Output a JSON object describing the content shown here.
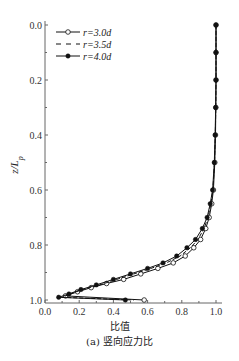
{
  "chart_data": {
    "type": "line",
    "title": "",
    "caption": "(a) 竖向应力比",
    "xlabel": "比值",
    "ylabel": "z/Lp",
    "xlim": [
      0.0,
      1.0
    ],
    "ylim": [
      0.0,
      1.0
    ],
    "y_inverted": true,
    "grid": false,
    "legend_position": "upper left",
    "x_ticks": [
      "0.0",
      "0.2",
      "0.4",
      "0.6",
      "0.8",
      "1.0"
    ],
    "y_ticks": [
      "0.0",
      "0.2",
      "0.4",
      "0.6",
      "0.8",
      "1.0"
    ],
    "series": [
      {
        "name": "r=3.0d",
        "marker": "open-circle",
        "line": "solid",
        "points": [
          [
            1.0,
            0.0
          ],
          [
            1.0,
            0.1
          ],
          [
            1.0,
            0.2
          ],
          [
            0.999,
            0.3
          ],
          [
            0.997,
            0.4
          ],
          [
            0.993,
            0.5
          ],
          [
            0.985,
            0.6
          ],
          [
            0.975,
            0.65
          ],
          [
            0.96,
            0.7
          ],
          [
            0.94,
            0.74
          ],
          [
            0.91,
            0.78
          ],
          [
            0.87,
            0.81
          ],
          [
            0.82,
            0.84
          ],
          [
            0.75,
            0.865
          ],
          [
            0.66,
            0.885
          ],
          [
            0.56,
            0.905
          ],
          [
            0.46,
            0.925
          ],
          [
            0.36,
            0.94
          ],
          [
            0.27,
            0.955
          ],
          [
            0.19,
            0.97
          ],
          [
            0.12,
            0.985
          ],
          [
            0.58,
            1.0
          ]
        ]
      },
      {
        "name": "r=3.5d",
        "marker": "none",
        "line": "dashed",
        "points": [
          [
            1.0,
            0.0
          ],
          [
            1.0,
            0.1
          ],
          [
            1.0,
            0.2
          ],
          [
            0.999,
            0.3
          ],
          [
            0.996,
            0.4
          ],
          [
            0.991,
            0.5
          ],
          [
            0.982,
            0.6
          ],
          [
            0.97,
            0.65
          ],
          [
            0.953,
            0.7
          ],
          [
            0.93,
            0.74
          ],
          [
            0.895,
            0.78
          ],
          [
            0.85,
            0.81
          ],
          [
            0.79,
            0.84
          ],
          [
            0.71,
            0.865
          ],
          [
            0.62,
            0.885
          ],
          [
            0.52,
            0.905
          ],
          [
            0.42,
            0.925
          ],
          [
            0.32,
            0.945
          ],
          [
            0.23,
            0.96
          ],
          [
            0.16,
            0.975
          ],
          [
            0.1,
            0.99
          ],
          [
            0.52,
            1.0
          ]
        ]
      },
      {
        "name": "r=4.0d",
        "marker": "filled-circle",
        "line": "solid",
        "points": [
          [
            1.0,
            0.0
          ],
          [
            1.0,
            0.1
          ],
          [
            1.0,
            0.2
          ],
          [
            0.998,
            0.3
          ],
          [
            0.995,
            0.4
          ],
          [
            0.99,
            0.5
          ],
          [
            0.98,
            0.6
          ],
          [
            0.966,
            0.65
          ],
          [
            0.948,
            0.7
          ],
          [
            0.92,
            0.74
          ],
          [
            0.88,
            0.78
          ],
          [
            0.83,
            0.81
          ],
          [
            0.77,
            0.84
          ],
          [
            0.69,
            0.865
          ],
          [
            0.6,
            0.885
          ],
          [
            0.5,
            0.905
          ],
          [
            0.4,
            0.925
          ],
          [
            0.3,
            0.945
          ],
          [
            0.21,
            0.962
          ],
          [
            0.14,
            0.978
          ],
          [
            0.08,
            0.99
          ],
          [
            0.47,
            1.0
          ]
        ]
      }
    ]
  }
}
